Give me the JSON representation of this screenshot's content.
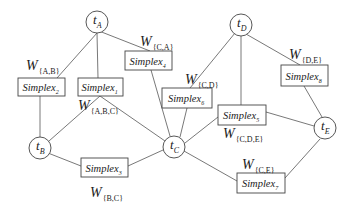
{
  "diagram": {
    "nodes": [
      {
        "id": "A",
        "label": "t",
        "sub": "A",
        "cx": 97,
        "cy": 22
      },
      {
        "id": "D",
        "label": "t",
        "sub": "D",
        "cx": 241,
        "cy": 25
      },
      {
        "id": "B",
        "label": "t",
        "sub": "B",
        "cx": 40,
        "cy": 148
      },
      {
        "id": "C",
        "label": "t",
        "sub": "C",
        "cx": 174,
        "cy": 147
      },
      {
        "id": "E",
        "label": "t",
        "sub": "E",
        "cx": 325,
        "cy": 128
      }
    ],
    "simplexes": [
      {
        "id": "s2",
        "label": "Simplex",
        "sub": "2",
        "x": 18,
        "y": 78,
        "w": 47,
        "h": 18
      },
      {
        "id": "s1",
        "label": "Simplex",
        "sub": "1",
        "x": 78,
        "y": 78,
        "w": 45,
        "h": 18
      },
      {
        "id": "s4",
        "label": "Simplex",
        "sub": "4",
        "x": 125,
        "y": 51,
        "w": 47,
        "h": 19
      },
      {
        "id": "s6",
        "label": "Simplex",
        "sub": "6",
        "x": 162,
        "y": 88,
        "w": 50,
        "h": 20
      },
      {
        "id": "s5",
        "label": "Simplex",
        "sub": "5",
        "x": 218,
        "y": 105,
        "w": 48,
        "h": 20
      },
      {
        "id": "s8",
        "label": "Simplex",
        "sub": "8",
        "x": 281,
        "y": 65,
        "w": 47,
        "h": 21
      },
      {
        "id": "s3",
        "label": "Simplex",
        "sub": "3",
        "x": 81,
        "y": 158,
        "w": 47,
        "h": 19
      },
      {
        "id": "s7",
        "label": "Simplex",
        "sub": "7",
        "x": 237,
        "y": 173,
        "w": 48,
        "h": 20
      }
    ],
    "weights": [
      {
        "id": "w_ab",
        "main": "W",
        "sub": "{A,B}",
        "x": 26,
        "y": 70
      },
      {
        "id": "w_ca",
        "main": "W",
        "sub": "{C,A}",
        "x": 140,
        "y": 46
      },
      {
        "id": "w_abc",
        "main": "W",
        "sub": "{A,B,C}",
        "x": 78,
        "y": 110
      },
      {
        "id": "w_cd",
        "main": "W",
        "sub": "{C,D}",
        "x": 185,
        "y": 84
      },
      {
        "id": "w_de",
        "main": "W",
        "sub": "{D,E}",
        "x": 289,
        "y": 59
      },
      {
        "id": "w_cde",
        "main": "W",
        "sub": "{C,D,E}",
        "x": 223,
        "y": 138
      },
      {
        "id": "w_ce",
        "main": "W",
        "sub": "{C,E}",
        "x": 242,
        "y": 169
      },
      {
        "id": "w_bc",
        "main": "W",
        "sub": "{B,C}",
        "x": 90,
        "y": 197
      }
    ],
    "edges": [
      {
        "from": [
          97,
          33
        ],
        "to": [
          57,
          78
        ]
      },
      {
        "from": [
          97,
          33
        ],
        "to": [
          98,
          78
        ]
      },
      {
        "from": [
          99,
          31
        ],
        "to": [
          150,
          51
        ]
      },
      {
        "from": [
          40,
          96
        ],
        "to": [
          40,
          137
        ]
      },
      {
        "from": [
          100,
          96
        ],
        "to": [
          49,
          141
        ]
      },
      {
        "from": [
          100,
          96
        ],
        "to": [
          165,
          141
        ]
      },
      {
        "from": [
          48,
          153
        ],
        "to": [
          81,
          166
        ]
      },
      {
        "from": [
          128,
          166
        ],
        "to": [
          163,
          150
        ]
      },
      {
        "from": [
          151,
          70
        ],
        "to": [
          170,
          136
        ]
      },
      {
        "from": [
          187,
          108
        ],
        "to": [
          180,
          137
        ]
      },
      {
        "from": [
          235,
          33
        ],
        "to": [
          190,
          88
        ]
      },
      {
        "from": [
          241,
          36
        ],
        "to": [
          241,
          105
        ]
      },
      {
        "from": [
          246,
          34
        ],
        "to": [
          300,
          65
        ]
      },
      {
        "from": [
          218,
          117
        ],
        "to": [
          185,
          143
        ]
      },
      {
        "from": [
          266,
          112
        ],
        "to": [
          314,
          126
        ]
      },
      {
        "from": [
          304,
          86
        ],
        "to": [
          322,
          117
        ]
      },
      {
        "from": [
          184,
          151
        ],
        "to": [
          237,
          181
        ]
      },
      {
        "from": [
          285,
          178
        ],
        "to": [
          320,
          139
        ]
      }
    ]
  }
}
